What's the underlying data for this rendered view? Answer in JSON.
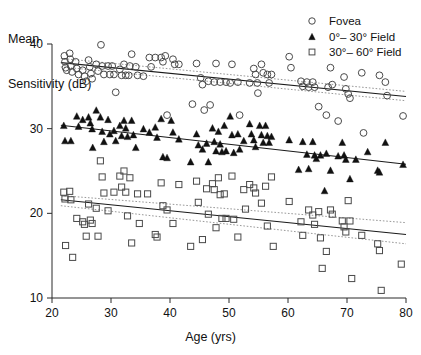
{
  "chart_data": {
    "type": "scatter",
    "title": "",
    "xlabel": "Age (yrs)",
    "ylabel": "Mean\nSensitivity (dB)",
    "ylabel_line1": "Mean",
    "ylabel_line2": "Sensitivity (dB)",
    "xlim": [
      20,
      80
    ],
    "ylim": [
      10,
      40
    ],
    "xticks": [
      20,
      30,
      40,
      50,
      60,
      70,
      80
    ],
    "yticks": [
      10,
      20,
      30,
      40
    ],
    "xtick_labels": [
      "20",
      "30",
      "40",
      "50",
      "60",
      "70",
      "80"
    ],
    "ytick_labels": [
      "10",
      "20",
      "30",
      "40"
    ],
    "grid": false,
    "legend_position": "top-right",
    "legend": [
      {
        "label": "Fovea",
        "marker": "open-circle"
      },
      {
        "label": "0°– 30° Field",
        "marker": "filled-triangle"
      },
      {
        "label": "30°– 60° Field",
        "marker": "open-square"
      }
    ],
    "series": [
      {
        "name": "Fovea",
        "marker": "open-circle",
        "fit": {
          "x": [
            21.5,
            80
          ],
          "y": [
            37.8,
            33.8
          ]
        },
        "ci_upper": {
          "x": [
            21.5,
            80
          ],
          "y": [
            38.3,
            34.4
          ]
        },
        "ci_lower": {
          "x": [
            21.5,
            80
          ],
          "y": [
            37.3,
            33.3
          ]
        },
        "points": [
          [
            22.1,
            38.6
          ],
          [
            22.2,
            37.9
          ],
          [
            22.3,
            37.2
          ],
          [
            22.5,
            36.9
          ],
          [
            23.0,
            38.9
          ],
          [
            23.1,
            38.2
          ],
          [
            23.2,
            37.4
          ],
          [
            23.4,
            36.7
          ],
          [
            24.0,
            37.9
          ],
          [
            24.2,
            37.1
          ],
          [
            24.5,
            36.4
          ],
          [
            25.2,
            36.9
          ],
          [
            25.5,
            36.2
          ],
          [
            25.8,
            35.6
          ],
          [
            26.2,
            38.1
          ],
          [
            26.4,
            37.3
          ],
          [
            26.6,
            36.5
          ],
          [
            26.8,
            35.9
          ],
          [
            27.5,
            37.6
          ],
          [
            27.8,
            36.8
          ],
          [
            28.3,
            39.9
          ],
          [
            28.5,
            37.4
          ],
          [
            28.8,
            36.4
          ],
          [
            29.5,
            37.4
          ],
          [
            29.8,
            36.4
          ],
          [
            30.2,
            37.4
          ],
          [
            30.5,
            36.4
          ],
          [
            30.8,
            34.3
          ],
          [
            31.5,
            37.0
          ],
          [
            31.8,
            36.3
          ],
          [
            32.2,
            37.6
          ],
          [
            32.5,
            36.3
          ],
          [
            33.0,
            36.3
          ],
          [
            33.2,
            37.4
          ],
          [
            33.5,
            38.8
          ],
          [
            34.2,
            37.3
          ],
          [
            34.5,
            36.3
          ],
          [
            35.5,
            36.2
          ],
          [
            36.5,
            38.4
          ],
          [
            36.8,
            37.3
          ],
          [
            37.5,
            38.4
          ],
          [
            38.5,
            38.4
          ],
          [
            38.8,
            37.9
          ],
          [
            39.2,
            38.6
          ],
          [
            39.5,
            31.6
          ],
          [
            40.5,
            38.2
          ],
          [
            40.8,
            37.6
          ],
          [
            41.5,
            37.6
          ],
          [
            43.8,
            32.9
          ],
          [
            44.5,
            37.7
          ],
          [
            45.2,
            36.0
          ],
          [
            45.5,
            35.2
          ],
          [
            45.8,
            32.2
          ],
          [
            46.5,
            35.6
          ],
          [
            46.8,
            32.8
          ],
          [
            47.5,
            35.5
          ],
          [
            47.8,
            37.7
          ],
          [
            48.5,
            35.5
          ],
          [
            49.5,
            35.5
          ],
          [
            50.2,
            35.4
          ],
          [
            50.5,
            37.6
          ],
          [
            51.5,
            35.5
          ],
          [
            51.8,
            31.6
          ],
          [
            53.5,
            35.4
          ],
          [
            54.2,
            37.1
          ],
          [
            54.5,
            36.4
          ],
          [
            54.8,
            35.4
          ],
          [
            54.9,
            34.2
          ],
          [
            55.5,
            37.6
          ],
          [
            55.8,
            36.6
          ],
          [
            56.5,
            36.4
          ],
          [
            56.8,
            35.4
          ],
          [
            57.2,
            36.4
          ],
          [
            60.2,
            38.5
          ],
          [
            60.5,
            37.2
          ],
          [
            62.2,
            35.6
          ],
          [
            62.5,
            35.0
          ],
          [
            63.2,
            35.5
          ],
          [
            63.5,
            34.9
          ],
          [
            64.2,
            35.5
          ],
          [
            64.5,
            34.9
          ],
          [
            65.2,
            32.6
          ],
          [
            66.5,
            31.6
          ],
          [
            66.8,
            34.9
          ],
          [
            67.2,
            37.2
          ],
          [
            67.5,
            35.2
          ],
          [
            68.5,
            30.9
          ],
          [
            69.5,
            36.1
          ],
          [
            69.8,
            34.7
          ],
          [
            70.2,
            34.1
          ],
          [
            70.5,
            33.6
          ],
          [
            72.5,
            36.6
          ],
          [
            72.8,
            29.5
          ],
          [
            75.5,
            36.3
          ],
          [
            76.5,
            35.5
          ],
          [
            76.8,
            33.9
          ],
          [
            79.5,
            31.5
          ]
        ]
      },
      {
        "name": "0°– 30° Field",
        "marker": "filled-triangle",
        "fit": {
          "x": [
            21.5,
            80
          ],
          "y": [
            30.4,
            25.8
          ]
        },
        "points": [
          [
            22.0,
            30.4
          ],
          [
            22.2,
            28.6
          ],
          [
            23.2,
            28.6
          ],
          [
            24.2,
            31.5
          ],
          [
            24.5,
            30.3
          ],
          [
            25.2,
            31.1
          ],
          [
            26.2,
            31.4
          ],
          [
            26.5,
            30.7
          ],
          [
            26.8,
            30.0
          ],
          [
            26.9,
            27.8
          ],
          [
            27.5,
            32.2
          ],
          [
            28.2,
            31.4
          ],
          [
            28.5,
            29.7
          ],
          [
            28.8,
            28.5
          ],
          [
            29.5,
            31.1
          ],
          [
            29.8,
            29.4
          ],
          [
            30.5,
            29.8
          ],
          [
            30.8,
            28.6
          ],
          [
            31.5,
            30.4
          ],
          [
            31.8,
            29.2
          ],
          [
            32.2,
            31.0
          ],
          [
            32.5,
            30.1
          ],
          [
            32.8,
            29.1
          ],
          [
            33.5,
            31.0
          ],
          [
            33.8,
            29.3
          ],
          [
            34.2,
            27.8
          ],
          [
            35.5,
            30.0
          ],
          [
            36.5,
            29.6
          ],
          [
            37.5,
            30.2
          ],
          [
            37.8,
            29.0
          ],
          [
            38.5,
            31.2
          ],
          [
            38.8,
            26.7
          ],
          [
            39.5,
            26.6
          ],
          [
            40.2,
            31.0
          ],
          [
            40.5,
            29.6
          ],
          [
            41.5,
            28.8
          ],
          [
            43.5,
            26.1
          ],
          [
            44.5,
            29.4
          ],
          [
            44.8,
            28.1
          ],
          [
            45.5,
            27.6
          ],
          [
            46.2,
            28.3
          ],
          [
            46.5,
            26.1
          ],
          [
            47.2,
            30.1
          ],
          [
            47.5,
            28.5
          ],
          [
            47.8,
            27.4
          ],
          [
            48.2,
            29.7
          ],
          [
            48.5,
            28.2
          ],
          [
            48.8,
            27.3
          ],
          [
            49.2,
            30.4
          ],
          [
            49.5,
            27.4
          ],
          [
            50.2,
            31.5
          ],
          [
            50.5,
            29.3
          ],
          [
            50.8,
            27.2
          ],
          [
            51.5,
            29.4
          ],
          [
            51.8,
            27.6
          ],
          [
            52.5,
            28.6
          ],
          [
            53.5,
            30.6
          ],
          [
            53.8,
            29.4
          ],
          [
            54.2,
            28.7
          ],
          [
            54.5,
            27.9
          ],
          [
            55.2,
            30.4
          ],
          [
            55.5,
            29.3
          ],
          [
            55.8,
            28.4
          ],
          [
            56.2,
            30.4
          ],
          [
            56.5,
            29.2
          ],
          [
            56.8,
            28.4
          ],
          [
            57.2,
            29.1
          ],
          [
            60.2,
            28.7
          ],
          [
            61.8,
            25.2
          ],
          [
            62.5,
            28.5
          ],
          [
            63.2,
            27.0
          ],
          [
            63.5,
            25.3
          ],
          [
            64.2,
            28.5
          ],
          [
            64.5,
            26.9
          ],
          [
            64.8,
            26.5
          ],
          [
            65.5,
            26.9
          ],
          [
            66.2,
            22.7
          ],
          [
            66.5,
            27.1
          ],
          [
            67.2,
            25.1
          ],
          [
            68.5,
            26.8
          ],
          [
            69.2,
            28.4
          ],
          [
            69.5,
            26.9
          ],
          [
            69.8,
            26.4
          ],
          [
            70.5,
            24.1
          ],
          [
            71.5,
            26.4
          ],
          [
            73.5,
            27.3
          ],
          [
            75.2,
            25.1
          ],
          [
            75.5,
            24.9
          ],
          [
            76.5,
            28.4
          ],
          [
            79.5,
            25.8
          ]
        ]
      },
      {
        "name": "30°– 60° Field",
        "marker": "open-square",
        "fit": {
          "x": [
            21.5,
            80
          ],
          "y": [
            21.6,
            17.5
          ]
        },
        "ci_upper": {
          "x": [
            21.5,
            80
          ],
          "y": [
            22.1,
            18.9
          ]
        },
        "ci_lower": {
          "x": [
            21.5,
            80
          ],
          "y": [
            20.9,
            16.4
          ]
        },
        "points": [
          [
            22.0,
            22.5
          ],
          [
            22.2,
            21.7
          ],
          [
            22.3,
            16.2
          ],
          [
            23.0,
            22.6
          ],
          [
            23.2,
            21.6
          ],
          [
            23.5,
            14.8
          ],
          [
            24.2,
            19.4
          ],
          [
            25.2,
            19.0
          ],
          [
            25.5,
            18.7
          ],
          [
            25.8,
            17.3
          ],
          [
            26.2,
            21.1
          ],
          [
            26.5,
            19.2
          ],
          [
            26.8,
            18.8
          ],
          [
            27.5,
            20.6
          ],
          [
            27.8,
            17.3
          ],
          [
            28.2,
            26.2
          ],
          [
            28.5,
            24.3
          ],
          [
            28.8,
            22.4
          ],
          [
            29.5,
            20.3
          ],
          [
            30.5,
            22.5
          ],
          [
            31.5,
            24.4
          ],
          [
            31.8,
            23.1
          ],
          [
            32.2,
            25.0
          ],
          [
            32.5,
            22.5
          ],
          [
            32.8,
            19.7
          ],
          [
            33.2,
            24.2
          ],
          [
            33.5,
            16.5
          ],
          [
            34.5,
            22.3
          ],
          [
            34.8,
            18.8
          ],
          [
            36.2,
            22.3
          ],
          [
            37.5,
            17.5
          ],
          [
            37.8,
            17.2
          ],
          [
            38.5,
            23.6
          ],
          [
            38.8,
            20.9
          ],
          [
            39.5,
            20.4
          ],
          [
            40.5,
            18.8
          ],
          [
            41.5,
            23.4
          ],
          [
            43.5,
            16.1
          ],
          [
            44.5,
            23.8
          ],
          [
            44.8,
            21.3
          ],
          [
            45.5,
            16.9
          ],
          [
            46.2,
            22.9
          ],
          [
            46.5,
            19.9
          ],
          [
            47.2,
            23.5
          ],
          [
            47.5,
            22.8
          ],
          [
            47.8,
            18.3
          ],
          [
            48.2,
            24.2
          ],
          [
            48.5,
            22.2
          ],
          [
            48.8,
            19.4
          ],
          [
            49.2,
            22.3
          ],
          [
            49.5,
            19.4
          ],
          [
            50.5,
            24.4
          ],
          [
            50.8,
            19.3
          ],
          [
            51.5,
            17.2
          ],
          [
            52.5,
            22.8
          ],
          [
            52.8,
            20.5
          ],
          [
            53.5,
            23.4
          ],
          [
            54.2,
            23.0
          ],
          [
            54.5,
            22.4
          ],
          [
            55.5,
            21.2
          ],
          [
            56.2,
            23.2
          ],
          [
            56.5,
            18.5
          ],
          [
            57.2,
            24.3
          ],
          [
            57.5,
            16.1
          ],
          [
            60.2,
            21.4
          ],
          [
            62.2,
            19.0
          ],
          [
            62.5,
            17.4
          ],
          [
            63.5,
            20.4
          ],
          [
            64.2,
            19.8
          ],
          [
            64.5,
            18.7
          ],
          [
            65.2,
            20.2
          ],
          [
            65.5,
            17.1
          ],
          [
            65.8,
            13.5
          ],
          [
            66.5,
            15.5
          ],
          [
            67.2,
            20.4
          ],
          [
            67.5,
            19.9
          ],
          [
            69.2,
            19.1
          ],
          [
            69.5,
            18.4
          ],
          [
            69.8,
            17.8
          ],
          [
            70.2,
            21.5
          ],
          [
            70.5,
            19.1
          ],
          [
            70.8,
            12.3
          ],
          [
            72.5,
            17.4
          ],
          [
            75.2,
            16.4
          ],
          [
            75.5,
            15.6
          ],
          [
            75.8,
            10.9
          ],
          [
            79.2,
            14.0
          ]
        ]
      }
    ]
  }
}
